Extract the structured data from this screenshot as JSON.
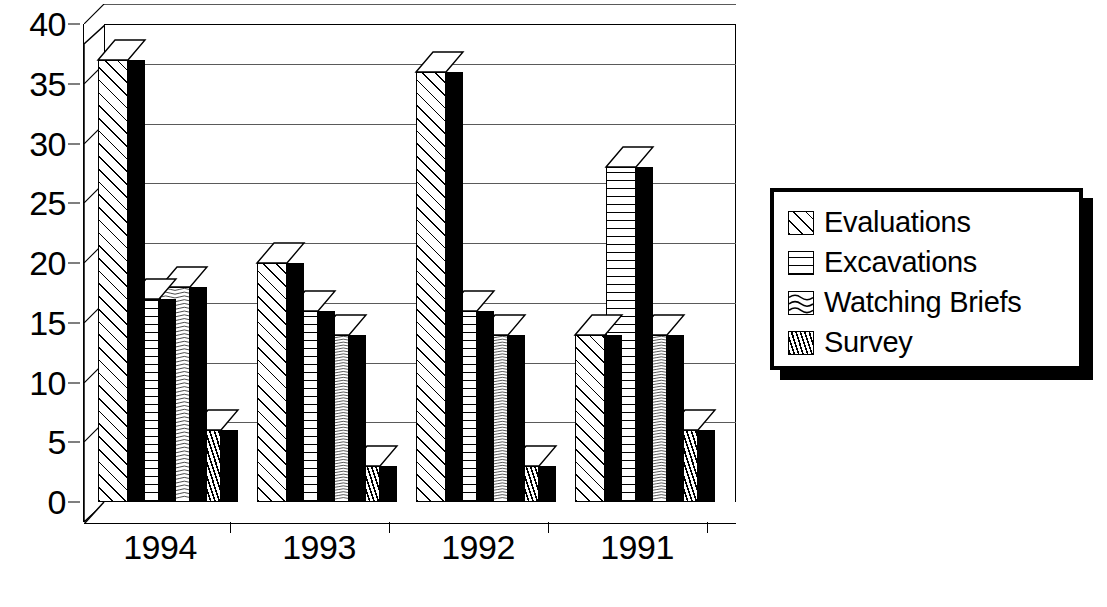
{
  "chart_data": {
    "type": "bar",
    "title": "",
    "subtitle": "",
    "xlabel": "",
    "ylabel": "",
    "categories": [
      "1994",
      "1993",
      "1992",
      "1991"
    ],
    "series": [
      {
        "name": "Evaluations",
        "pattern": "diagonal-hatch",
        "values": [
          37,
          20,
          36,
          14
        ]
      },
      {
        "name": "Excavations",
        "pattern": "horizontal-lines",
        "values": [
          17,
          16,
          16,
          28
        ]
      },
      {
        "name": "Watching Briefs",
        "pattern": "wavy-lines",
        "values": [
          18,
          14,
          14,
          14
        ]
      },
      {
        "name": "Survey",
        "pattern": "fine-dots",
        "values": [
          6,
          3,
          3,
          6
        ]
      }
    ],
    "ylim": [
      0,
      40
    ],
    "yticks": [
      0,
      5,
      10,
      15,
      20,
      25,
      30,
      35,
      40
    ],
    "ytick_labels": [
      "0",
      "5",
      "10",
      "15",
      "20",
      "25",
      "30",
      "35",
      "40"
    ],
    "grid": true,
    "legend_position": "right",
    "style": "3d-bar-black-and-white"
  },
  "axes": {
    "y_labels": [
      "40",
      "35",
      "30",
      "25",
      "20",
      "15",
      "10",
      "5",
      "0"
    ],
    "x_labels": [
      "1994",
      "1993",
      "1992",
      "1991"
    ]
  },
  "legend": {
    "items": [
      {
        "label": "Evaluations"
      },
      {
        "label": "Excavations"
      },
      {
        "label": "Watching Briefs"
      },
      {
        "label": "Survey"
      }
    ]
  }
}
